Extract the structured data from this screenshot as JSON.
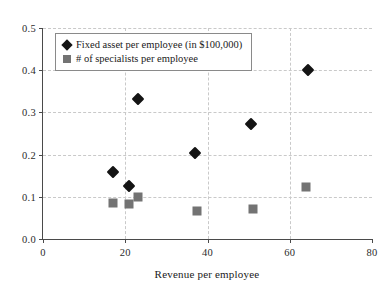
{
  "chart_data": {
    "type": "scatter",
    "title": "",
    "xlabel": "Revenue per employee",
    "ylabel": "",
    "xlim": [
      0,
      80
    ],
    "ylim": [
      0.0,
      0.5
    ],
    "xticks": [
      "0",
      "20",
      "40",
      "60",
      "80"
    ],
    "xtick_values": [
      0,
      20,
      40,
      60,
      80
    ],
    "yticks": [
      "0.0",
      "0.1",
      "0.2",
      "0.3",
      "0.4",
      "0.5"
    ],
    "ytick_values": [
      0.0,
      0.1,
      0.2,
      0.3,
      0.4,
      0.5
    ],
    "grid": true,
    "legend_position": "top-left",
    "series": [
      {
        "name": "Fixed asset per employee (in $100,000)",
        "marker": "diamond",
        "color": "#141414",
        "points": [
          {
            "x": 17.0,
            "y": 0.158
          },
          {
            "x": 21.0,
            "y": 0.125
          },
          {
            "x": 23.0,
            "y": 0.331
          },
          {
            "x": 37.0,
            "y": 0.204
          },
          {
            "x": 50.5,
            "y": 0.273
          },
          {
            "x": 64.5,
            "y": 0.4
          }
        ]
      },
      {
        "name": "# of specialists per employee",
        "marker": "square",
        "color": "#737373",
        "points": [
          {
            "x": 17.0,
            "y": 0.086
          },
          {
            "x": 21.0,
            "y": 0.084
          },
          {
            "x": 23.0,
            "y": 0.099
          },
          {
            "x": 37.5,
            "y": 0.066
          },
          {
            "x": 51.0,
            "y": 0.071
          },
          {
            "x": 64.0,
            "y": 0.124
          }
        ]
      }
    ]
  }
}
